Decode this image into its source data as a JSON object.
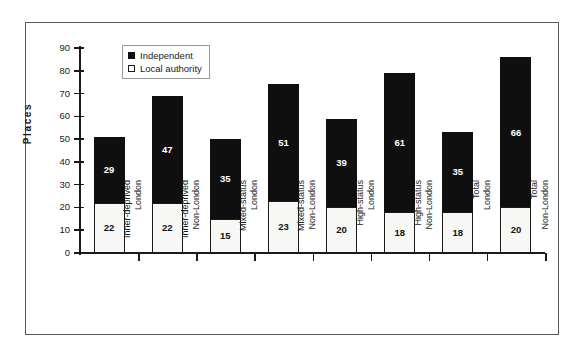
{
  "chart_data": {
    "type": "bar",
    "subtype": "stacked-vertical",
    "title": "",
    "xlabel": "",
    "ylabel": "Places",
    "ylim": [
      0,
      90
    ],
    "ytick_step": 10,
    "yticks": [
      90,
      80,
      70,
      60,
      50,
      40,
      30,
      20,
      10,
      0
    ],
    "grid": false,
    "legend_position": "top-left-inside",
    "categories": [
      [
        "Inner-deprived",
        "London"
      ],
      [
        "Inner-deprived",
        "Non-London"
      ],
      [
        "Mixed-status",
        "London"
      ],
      [
        "Mixed-status",
        "Non-London"
      ],
      [
        "High-status",
        "London"
      ],
      [
        "High-status",
        "Non-London"
      ],
      [
        "Total",
        "London"
      ],
      [
        "Total",
        "Non-London"
      ]
    ],
    "series": [
      {
        "name": "Local authority",
        "swatch": "hollow",
        "color": "#ffffff",
        "values": [
          22,
          22,
          15,
          23,
          20,
          18,
          18,
          20
        ]
      },
      {
        "name": "Independent",
        "swatch": "filled",
        "color": "#100f10",
        "values": [
          29,
          47,
          35,
          51,
          39,
          61,
          35,
          66
        ]
      }
    ],
    "totals": [
      51,
      69,
      50,
      74,
      59,
      79,
      53,
      86
    ]
  },
  "legend": {
    "items": [
      {
        "label": "Independent",
        "swatch": "filled"
      },
      {
        "label": "Local authority",
        "swatch": "hollow"
      }
    ]
  },
  "axis": {
    "y_title": "Places"
  },
  "colors": {
    "independent": "#100f10",
    "local_authority": "#ffffff",
    "axis": "#1a1a1a",
    "frame": "#58585a",
    "background": "#ffffff"
  }
}
